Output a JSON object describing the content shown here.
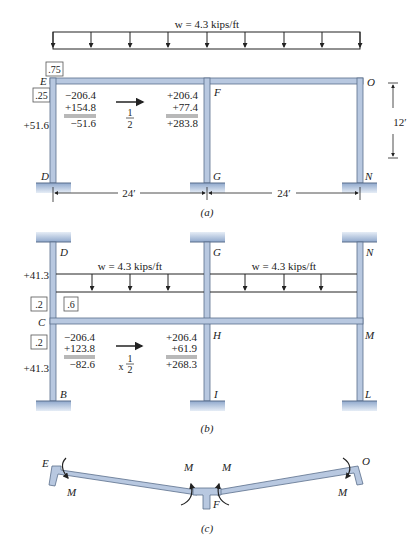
{
  "colors": {
    "member_fill": "#b8c8e0",
    "member_stroke": "#5a6e8c",
    "support_fill": "#9fb6d6",
    "line": "#222222"
  },
  "figure_a": {
    "load_label": "w = 4.3 kips/ft",
    "df_top": ".75",
    "df_side": ".25",
    "nodes": {
      "E": "E",
      "O": "O",
      "F": "F",
      "D": "D",
      "G": "G",
      "N": "N"
    },
    "column_moment": "+51.6",
    "left_calc": [
      "−206.4",
      "+154.8",
      "−51.6"
    ],
    "carryover": {
      "num": "1",
      "den": "2"
    },
    "right_calc": [
      "+206.4",
      "+77.4",
      "+283.8"
    ],
    "height_dim": "12′",
    "span_left": "24′",
    "span_right": "24′",
    "caption": "(a)"
  },
  "figure_b": {
    "load_label_left": "w = 4.3 kips/ft",
    "load_label_right": "w = 4.3 kips/ft",
    "nodes": {
      "D": "D",
      "G": "G",
      "N": "N",
      "C": "C",
      "H": "H",
      "M": "M",
      "B": "B",
      "I": "I",
      "L": "L"
    },
    "upper_moment": "+41.3",
    "lower_moment": "+41.3",
    "df_upper_col": ".2",
    "df_beam": ".6",
    "df_lower_col": ".2",
    "left_calc": [
      "−206.4",
      "+123.8",
      "−82.6"
    ],
    "carryover": {
      "prefix": "x",
      "num": "1",
      "den": "2"
    },
    "right_calc": [
      "+206.4",
      "+61.9",
      "+268.3"
    ],
    "caption": "(b)"
  },
  "figure_c": {
    "nodes": {
      "E": "E",
      "O": "O",
      "F": "F"
    },
    "moment_labels": [
      "M",
      "M",
      "M",
      "M"
    ],
    "caption": "(c)"
  }
}
